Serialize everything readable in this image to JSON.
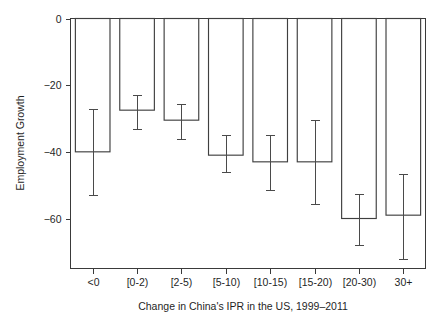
{
  "chart_data": {
    "type": "bar",
    "title": "",
    "subtitle": "",
    "xlabel": "Change in China's IPR in the US, 1999–2011",
    "ylabel": "Employment Growth",
    "categories": [
      "<0",
      "[0-2)",
      "[2-5)",
      "[5-10)",
      "[10-15)",
      "[15-20)",
      "[20-30)",
      "30+"
    ],
    "values": [
      -40,
      -27.5,
      -30.5,
      -41,
      -43,
      -43,
      -60,
      -59
    ],
    "error_low": [
      -53,
      -33,
      -36,
      -46,
      -51.5,
      -55.5,
      -68,
      -72
    ],
    "error_high": [
      -27,
      -23,
      -25.5,
      -35,
      -35,
      -30.5,
      -52.5,
      -46.5
    ],
    "series": [
      {
        "name": "Employment Growth",
        "values": [
          -40,
          -27.5,
          -30.5,
          -41,
          -43,
          -43,
          -60,
          -59
        ]
      }
    ],
    "ylim": [
      -75,
      0
    ],
    "yticks": [
      0,
      -20,
      -40,
      -60
    ],
    "ytick_labels": [
      "0",
      "−20",
      "−40",
      "−60"
    ],
    "grid": false,
    "legend": "none",
    "baseline": 0,
    "bar_style": {
      "fill": "#ffffff",
      "edge": "#3f3f3f"
    },
    "error_style": {
      "color": "#4a4a4a",
      "cap": true
    }
  },
  "axes": {
    "y_title": "Employment Growth",
    "x_title": "Change in China's IPR in the US, 1999–2011"
  }
}
